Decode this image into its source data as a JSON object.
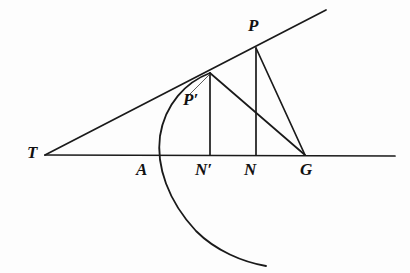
{
  "figure": {
    "background_color": "#fdfdfd",
    "stroke_color": "#1a1a1a",
    "width": 410,
    "height": 273,
    "labels": {
      "T": "T",
      "A": "A",
      "P": "P",
      "P_prime": "P′",
      "N_prime": "N′",
      "N": "N",
      "G": "G"
    },
    "points": {
      "T": {
        "x": 45,
        "y": 155
      },
      "A": {
        "x": 162,
        "y": 155
      },
      "P_prime": {
        "x": 210,
        "y": 73
      },
      "N_prime": {
        "x": 210,
        "y": 155
      },
      "P": {
        "x": 256,
        "y": 48
      },
      "N": {
        "x": 256,
        "y": 155
      },
      "G": {
        "x": 305,
        "y": 155
      },
      "baseline_right_end": {
        "x": 395,
        "y": 156
      },
      "tangent_right_end": {
        "x": 326,
        "y": 10
      },
      "curve_bottom_end": {
        "x": 266,
        "y": 266
      }
    },
    "segments": [
      {
        "name": "baseline-T-to-right",
        "from": "T",
        "to": "baseline_right_end"
      },
      {
        "name": "tangent-T-to-upper-right",
        "from": "T",
        "to": "tangent_right_end"
      },
      {
        "name": "ordinate-P-prime-N-prime",
        "from": "P_prime",
        "to": "N_prime"
      },
      {
        "name": "ordinate-P-N",
        "from": "P",
        "to": "N"
      },
      {
        "name": "normal-P-prime-G",
        "from": "P_prime",
        "to": "G"
      },
      {
        "name": "normal-P-G",
        "from": "P",
        "to": "G"
      }
    ],
    "curve": {
      "name": "parabolic-curve-through-P-prime-and-A",
      "description": "Curve passing through P′, crossing the axis near A, opening downward to the right"
    }
  }
}
